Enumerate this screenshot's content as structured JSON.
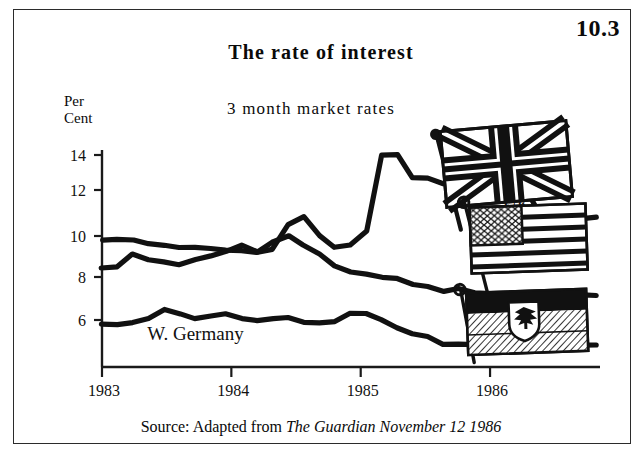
{
  "figure": {
    "number": "10.3"
  },
  "header": {
    "title": "The rate of interest",
    "subtitle": "3 month market rates"
  },
  "axis_unit": {
    "line1": "Per",
    "line2": "Cent"
  },
  "source": {
    "prefix": "Source: Adapted from ",
    "publication": "The Guardian November 12 1986"
  },
  "flags": [
    {
      "name": "uk-flag",
      "country": "UK",
      "description": "Union Jack"
    },
    {
      "name": "us-flag",
      "country": "US",
      "description": "Stars and Stripes"
    },
    {
      "name": "west-germany-flag",
      "country": "W. Germany",
      "description": "German flag with eagle emblem"
    }
  ],
  "colors": {
    "line": "#111111",
    "axis": "#1a1a1a",
    "background": "#ffffff",
    "border": "#2b2b2b"
  },
  "chart_data": {
    "type": "line",
    "title": "The rate of interest",
    "subtitle": "3 month market rates",
    "xlabel": "",
    "ylabel": "Per Cent",
    "ylim": [
      4,
      14.6
    ],
    "xlim": [
      1983.0,
      1986.85
    ],
    "yticks": [
      6,
      8,
      10,
      12,
      14
    ],
    "xticks": [
      1983,
      1984,
      1985,
      1986
    ],
    "grid": false,
    "legend": "inline-labels",
    "series": [
      {
        "name": "UK",
        "label_x": 1986.1,
        "label_y": 11.3,
        "x": [
          1983.0,
          1983.12,
          1983.24,
          1983.36,
          1983.48,
          1983.6,
          1983.72,
          1983.84,
          1983.96,
          1984.08,
          1984.2,
          1984.32,
          1984.44,
          1984.56,
          1984.68,
          1984.8,
          1984.92,
          1985.04,
          1985.16,
          1985.28,
          1985.4,
          1985.52,
          1985.64,
          1985.76,
          1985.88,
          1986.0,
          1986.12,
          1986.24,
          1986.36,
          1986.48,
          1986.6,
          1986.72,
          1986.82
        ],
        "values": [
          9.9,
          9.9,
          9.85,
          9.7,
          9.6,
          9.55,
          9.5,
          9.45,
          9.4,
          9.35,
          9.3,
          9.45,
          10.6,
          11.0,
          10.1,
          9.5,
          9.6,
          10.3,
          14.0,
          14.0,
          12.9,
          12.9,
          12.6,
          12.5,
          12.4,
          12.3,
          12.7,
          12.7,
          11.4,
          10.1,
          9.9,
          10.9,
          11.0
        ]
      },
      {
        "name": "US",
        "label_x": 1986.05,
        "label_y": 8.3,
        "x": [
          1983.0,
          1983.12,
          1983.24,
          1983.36,
          1983.48,
          1983.6,
          1983.72,
          1983.84,
          1983.96,
          1984.08,
          1984.2,
          1984.32,
          1984.44,
          1984.56,
          1984.68,
          1984.8,
          1984.92,
          1985.04,
          1985.16,
          1985.28,
          1985.4,
          1985.52,
          1985.64,
          1985.76,
          1985.88,
          1986.0,
          1986.12,
          1986.24,
          1986.36,
          1986.48,
          1986.6,
          1986.72,
          1986.82
        ],
        "values": [
          8.5,
          8.6,
          9.2,
          8.9,
          8.8,
          8.7,
          8.9,
          9.1,
          9.3,
          9.6,
          9.3,
          9.8,
          10.1,
          9.6,
          9.2,
          8.6,
          8.3,
          8.2,
          8.1,
          8.0,
          7.7,
          7.6,
          7.4,
          7.5,
          7.3,
          7.3,
          7.2,
          7.2,
          7.2,
          7.2,
          7.2,
          7.2,
          7.2
        ]
      },
      {
        "name": "W. Germany",
        "label_x": 1983.35,
        "label_y": 5.05,
        "x": [
          1983.0,
          1983.12,
          1983.24,
          1983.36,
          1983.48,
          1983.6,
          1983.72,
          1983.84,
          1983.96,
          1984.08,
          1984.2,
          1984.32,
          1984.44,
          1984.56,
          1984.68,
          1984.8,
          1984.92,
          1985.04,
          1985.16,
          1985.28,
          1985.4,
          1985.52,
          1985.64,
          1985.76,
          1985.88,
          1986.0,
          1986.12,
          1986.24,
          1986.36,
          1986.48,
          1986.6,
          1986.72,
          1986.82
        ],
        "values": [
          5.8,
          5.75,
          5.9,
          6.1,
          6.5,
          6.3,
          6.1,
          6.2,
          6.3,
          6.1,
          5.95,
          6.1,
          6.1,
          5.9,
          5.85,
          5.9,
          6.3,
          6.35,
          6.0,
          5.6,
          5.3,
          5.2,
          4.85,
          4.8,
          4.8,
          4.75,
          4.6,
          4.7,
          4.75,
          4.75,
          4.75,
          4.75,
          4.8
        ]
      }
    ]
  }
}
